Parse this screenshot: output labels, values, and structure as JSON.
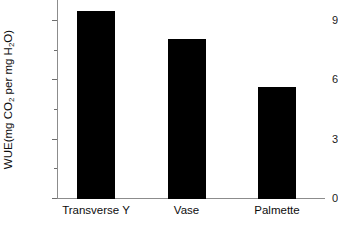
{
  "chart_data": {
    "type": "bar",
    "title": "",
    "xlabel": "",
    "ylabel": "WUE(mg CO2 per mg H2O)",
    "ylabel_parts": {
      "pre": "WUE(mg CO",
      "sub1": "2",
      "mid": " per mg H",
      "sub2": "2",
      "post": "O)"
    },
    "categories": [
      "Transverse Y",
      "Vase",
      "Palmette"
    ],
    "values": [
      9.5,
      8.1,
      5.65
    ],
    "ylim": [
      0,
      9.9
    ],
    "ymajor_ticks": [
      0,
      3,
      6,
      9
    ],
    "ymajor_tick_labels": [
      "0",
      "3",
      "6",
      "9"
    ],
    "yminor_ticks": [
      1.5,
      4.5,
      7.5
    ],
    "grid": false,
    "legend": null,
    "bar_color": "#000000",
    "axis_color": "#8c8c8c",
    "text_color": "#0d0d0d"
  }
}
